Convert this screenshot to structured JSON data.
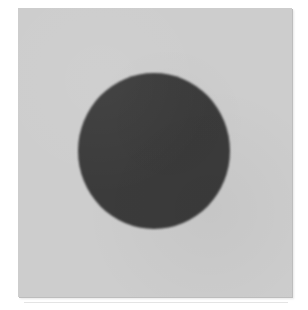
{
  "image": {
    "description": "Grainy scanned photograph of a solid dark gray circle centered on a light gray square card over a white background",
    "background_color": "#ffffff",
    "card": {
      "color": "#cdcdcd",
      "left": "18px",
      "top": "8px",
      "width": "274px",
      "height": "289px",
      "edge_shadow": "1px 1px 0 0 #bdbdbd, 2px 2px 2px 0 #e6e6e6"
    },
    "circle": {
      "color": "#3b3b3b",
      "left": "60px",
      "top": "65px",
      "width": "152px",
      "height": "156px"
    },
    "scan_line": {
      "color": "#e4e4e4",
      "left": "24px",
      "top": "302px",
      "width": "264px",
      "height": "1px"
    }
  }
}
